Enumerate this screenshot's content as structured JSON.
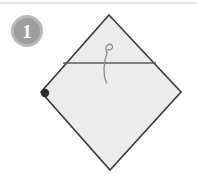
{
  "figure": {
    "name": "origami-fold-step",
    "step_label": "1",
    "background_color": "#ffffff"
  },
  "top_divider": {
    "color": "#d9d9d9"
  },
  "badge": {
    "number": "1",
    "ring_color": "#b9b9b9",
    "fill_color": "#9d9d9d",
    "text_color": "#ffffff"
  },
  "paper": {
    "shape": "diamond",
    "fill_color": "#ececec",
    "edge_color": "#3a3a3a",
    "vertices": {
      "top": [
        109,
        15
      ],
      "right": [
        181,
        92
      ],
      "bottom": [
        110,
        170
      ],
      "left": [
        41,
        92
      ]
    }
  },
  "fold_line": {
    "color": "#5d5d5d",
    "start": [
      63,
      63
    ],
    "end": [
      156,
      63
    ]
  },
  "corner_dot": {
    "color": "#2b2b2b",
    "center": [
      45,
      93
    ],
    "radius": 4.2
  },
  "fold_arrow": {
    "color": "#8a8a8a",
    "start": [
      106,
      83
    ],
    "end": [
      108,
      45
    ],
    "direction": "upward-curved"
  }
}
